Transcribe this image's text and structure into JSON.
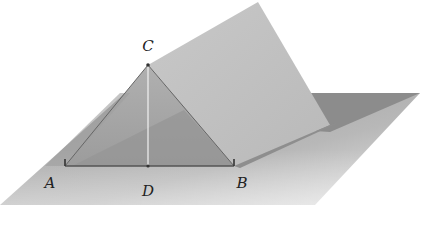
{
  "diagram": {
    "type": "3d-geometry",
    "points": {
      "A": {
        "label": "A",
        "x": 65,
        "y": 166,
        "label_x": 50,
        "label_y": 188
      },
      "B": {
        "label": "B",
        "x": 234,
        "y": 166,
        "label_x": 242,
        "label_y": 188
      },
      "C": {
        "label": "C",
        "x": 148,
        "y": 65,
        "label_x": 148,
        "label_y": 51
      },
      "D": {
        "label": "D",
        "x": 148,
        "y": 166,
        "label_x": 148,
        "label_y": 196
      }
    },
    "segments": [
      "AB",
      "AC",
      "BC",
      "CD"
    ],
    "colors": {
      "ground_plane": "#b5b5b5",
      "ground_plane_dark": "#8a8a8a",
      "tilted_plane": "#c4c4c4",
      "triangle_face": "#a8a8a8",
      "shadow": "#7e7e7e",
      "edge": "#555555",
      "altitude": "#eeeeee"
    }
  }
}
